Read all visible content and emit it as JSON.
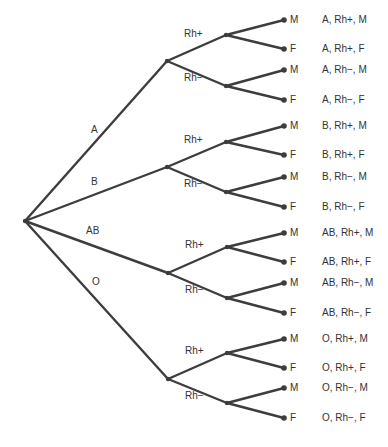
{
  "diagram": {
    "type": "tree",
    "root": {
      "x": 25,
      "y": 221
    },
    "blood_types": [
      {
        "label": "A",
        "node": {
          "x": 167,
          "y": 61
        },
        "label_pos": {
          "x": 91,
          "y": 130
        },
        "rh": [
          {
            "label": "Rh+",
            "node": {
              "x": 226,
              "y": 35
            },
            "label_pos": {
              "x": 184,
              "y": 34
            },
            "leaves": [
              {
                "sex": "M",
                "y": 20,
                "outcome": "A, Rh+, M"
              },
              {
                "sex": "F",
                "y": 49,
                "outcome": "A, Rh+, F"
              }
            ]
          },
          {
            "label": "Rh−",
            "node": {
              "x": 226,
              "y": 86
            },
            "label_pos": {
              "x": 184,
              "y": 78
            },
            "leaves": [
              {
                "sex": "M",
                "y": 70,
                "outcome": "A, Rh−, M"
              },
              {
                "sex": "F",
                "y": 100,
                "outcome": "A, Rh−, F"
              }
            ]
          }
        ]
      },
      {
        "label": "B",
        "node": {
          "x": 167,
          "y": 167
        },
        "label_pos": {
          "x": 91,
          "y": 182
        },
        "rh": [
          {
            "label": "Rh+",
            "node": {
              "x": 226,
              "y": 142
            },
            "label_pos": {
              "x": 184,
              "y": 140
            },
            "leaves": [
              {
                "sex": "M",
                "y": 126,
                "outcome": "B, Rh+, M"
              },
              {
                "sex": "F",
                "y": 155,
                "outcome": "B, Rh+, F"
              }
            ]
          },
          {
            "label": "Rh−",
            "node": {
              "x": 226,
              "y": 192
            },
            "label_pos": {
              "x": 184,
              "y": 184
            },
            "leaves": [
              {
                "sex": "M",
                "y": 177,
                "outcome": "B, Rh−, M"
              },
              {
                "sex": "F",
                "y": 207,
                "outcome": "B, Rh−, F"
              }
            ]
          }
        ]
      },
      {
        "label": "AB",
        "node": {
          "x": 168,
          "y": 273
        },
        "label_pos": {
          "x": 86,
          "y": 231
        },
        "rh": [
          {
            "label": "Rh+",
            "node": {
              "x": 227,
              "y": 247
            },
            "label_pos": {
              "x": 185,
              "y": 245
            },
            "leaves": [
              {
                "sex": "M",
                "y": 233,
                "outcome": "AB, Rh+, M"
              },
              {
                "sex": "F",
                "y": 262,
                "outcome": "AB, Rh+, F"
              }
            ]
          },
          {
            "label": "Rh−",
            "node": {
              "x": 227,
              "y": 298
            },
            "label_pos": {
              "x": 185,
              "y": 290
            },
            "leaves": [
              {
                "sex": "M",
                "y": 283,
                "outcome": "AB, Rh−, M"
              },
              {
                "sex": "F",
                "y": 313,
                "outcome": "AB, Rh−, F"
              }
            ]
          }
        ]
      },
      {
        "label": "O",
        "node": {
          "x": 168,
          "y": 379
        },
        "label_pos": {
          "x": 92,
          "y": 282
        },
        "rh": [
          {
            "label": "Rh+",
            "node": {
              "x": 227,
              "y": 353
            },
            "label_pos": {
              "x": 185,
              "y": 351
            },
            "leaves": [
              {
                "sex": "M",
                "y": 339,
                "outcome": "O, Rh+, M"
              },
              {
                "sex": "F",
                "y": 368,
                "outcome": "O, Rh+, F"
              }
            ]
          },
          {
            "label": "Rh−",
            "node": {
              "x": 227,
              "y": 403
            },
            "label_pos": {
              "x": 185,
              "y": 396
            },
            "leaves": [
              {
                "sex": "M",
                "y": 388,
                "outcome": "O, Rh−, M"
              },
              {
                "sex": "F",
                "y": 418,
                "outcome": "O, Rh−, F"
              }
            ]
          }
        ]
      }
    ],
    "leaf_x": 284,
    "sex_label_x": 290,
    "outcome_label_x": 322,
    "colors": {
      "line": "#3d3d3d",
      "text": "#333333",
      "background": "#ffffff"
    }
  }
}
